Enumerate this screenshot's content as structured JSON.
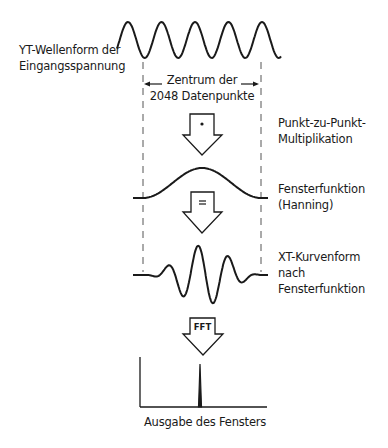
{
  "diagram": {
    "title_labels": {
      "input_waveform": [
        "YT-Wellenform der",
        "Eingangsspannung"
      ],
      "center_region": [
        "Zentrum der",
        "2048 Datenpunkte"
      ],
      "multiplication": [
        "Punkt-zu-Punkt-",
        "Multiplikation"
      ],
      "window_function": [
        "Fensterfunktion",
        "(Hanning)"
      ],
      "windowed_waveform": [
        "XT-Kurvenform",
        "nach",
        "Fensterfunktion"
      ],
      "output": "Ausgabe des Fensters"
    },
    "arrows": [
      {
        "name": "multiply-arrow",
        "symbol": "·"
      },
      {
        "name": "equals-arrow",
        "symbol": "="
      },
      {
        "name": "fft-arrow",
        "symbol": "FFT"
      }
    ],
    "stroke_color": "#1a1a1a",
    "dash_color": "#555555",
    "input_cycles": 4.5,
    "window_type": "Hanning",
    "data_points": 2048
  }
}
